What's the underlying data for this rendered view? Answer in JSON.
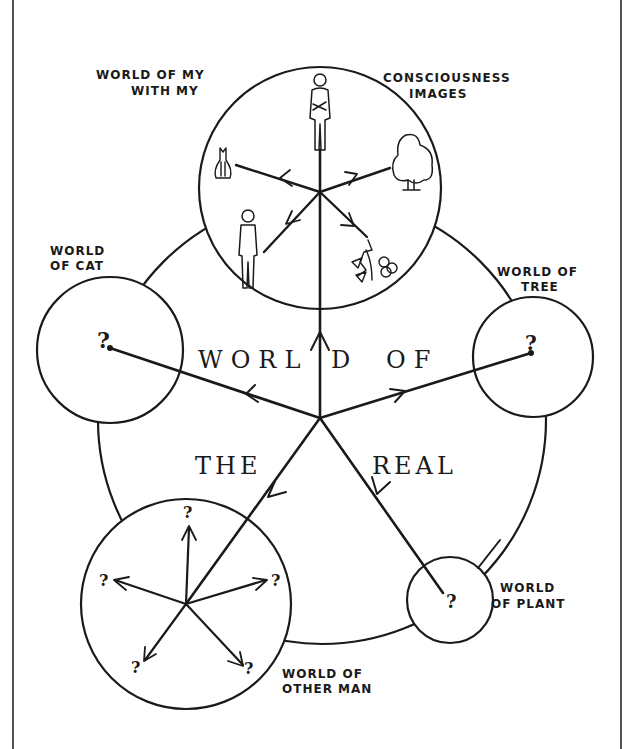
{
  "diagram": {
    "labels": {
      "my_world_line1": "WORLD OF MY",
      "my_world_line2": "WITH MY",
      "consciousness_line1": "CONSCIOUSNESS",
      "consciousness_line2": "IMAGES",
      "cat_line1": "WORLD",
      "cat_line2": "OF CAT",
      "tree_line1": "WORLD OF",
      "tree_line2": "TREE",
      "plant_line1": "WORLD",
      "plant_line2": "OF PLANT",
      "other_man_line1": "WORLD OF",
      "other_man_line2": "OTHER MAN"
    },
    "central_text": {
      "w1": "WORL",
      "w2": "D",
      "w3": "OF",
      "w4": "THE",
      "w5": "REAL"
    },
    "question_mark": "?",
    "nodes": [
      {
        "id": "consciousness",
        "icons": [
          "man-figure-icon",
          "cat-icon",
          "tree-icon",
          "other-man-figure-icon",
          "flower-icon"
        ]
      },
      {
        "id": "cat"
      },
      {
        "id": "tree"
      },
      {
        "id": "other-man"
      },
      {
        "id": "plant"
      }
    ],
    "colors": {
      "ink": "#1a1a1a",
      "paper": "#ffffff"
    }
  }
}
